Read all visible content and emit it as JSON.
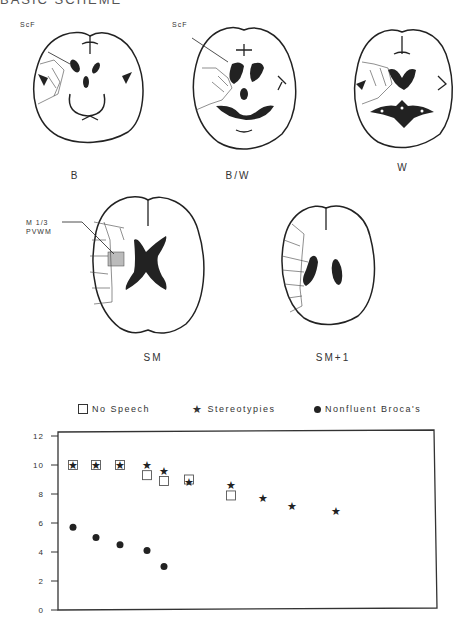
{
  "header": {
    "title": "BASIC SCHEME"
  },
  "diagrams": [
    {
      "id": "B",
      "label": "B",
      "annotation": "ScF"
    },
    {
      "id": "BW",
      "label": "B/W",
      "annotation": "ScF"
    },
    {
      "id": "W",
      "label": "W"
    },
    {
      "id": "SM",
      "label": "SM",
      "annotation_line1": "M 1/3",
      "annotation_line2": "PVWM"
    },
    {
      "id": "SM1",
      "label": "SM+1"
    }
  ],
  "legend": {
    "no_speech": "No Speech",
    "stereotypies": "Stereotypies",
    "nonfluent": "Nonfluent Broca's"
  },
  "colors": {
    "ink": "#222222",
    "frame": "#333333"
  },
  "chart_data": {
    "type": "scatter",
    "title": "",
    "xlabel": "",
    "ylabel": "",
    "ylim": [
      0,
      12
    ],
    "yticks": [
      0,
      2,
      4,
      6,
      8,
      10,
      12
    ],
    "grid": false,
    "legend_position": "top",
    "series": [
      {
        "name": "No Speech",
        "marker": "open-square",
        "points": [
          [
            1,
            10.0
          ],
          [
            2,
            10.0
          ],
          [
            3,
            10.0
          ],
          [
            4,
            9.3
          ],
          [
            5,
            8.9
          ],
          [
            6,
            9.0
          ],
          [
            7,
            7.9
          ]
        ]
      },
      {
        "name": "Stereotypies",
        "marker": "star",
        "points": [
          [
            1,
            10.0
          ],
          [
            2,
            10.0
          ],
          [
            3,
            10.0
          ],
          [
            4,
            10.0
          ],
          [
            5,
            9.6
          ],
          [
            6,
            8.8
          ],
          [
            7,
            8.6
          ],
          [
            8,
            7.7
          ],
          [
            9,
            7.2
          ],
          [
            10,
            6.8
          ]
        ]
      },
      {
        "name": "Nonfluent Broca's",
        "marker": "filled-circle",
        "points": [
          [
            1,
            5.7
          ],
          [
            2,
            5.0
          ],
          [
            3,
            4.5
          ],
          [
            4,
            4.1
          ],
          [
            5,
            3.0
          ]
        ]
      }
    ],
    "x_pixel_positions": [
      73,
      96,
      120,
      147,
      164,
      189,
      231,
      263,
      292,
      336
    ]
  }
}
